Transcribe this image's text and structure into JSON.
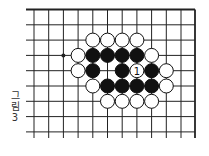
{
  "figure": {
    "label_lines": [
      "그",
      "림",
      "3"
    ],
    "label": "그림 3"
  },
  "board": {
    "cols_x": [
      34,
      48.7,
      63.4,
      78.1,
      92.8,
      107.5,
      122.2,
      136.9,
      151.6,
      166.3,
      181,
      195
    ],
    "rows_y": [
      9.5,
      24.8,
      40.1,
      55.4,
      70.7,
      86,
      101.3,
      116.6,
      131.9
    ],
    "grid_left": 26,
    "grid_right": 195,
    "grid_top": 9.5,
    "grid_bottom": 138,
    "top_border": true,
    "right_border": true,
    "stone_radius": 7,
    "line_color": "#222222",
    "black_color": "#111111",
    "white_color": "#ffffff",
    "star_point": {
      "col": 2,
      "row": 3
    },
    "stones": [
      {
        "col": 4,
        "row": 2,
        "color": "white"
      },
      {
        "col": 5,
        "row": 2,
        "color": "white"
      },
      {
        "col": 6,
        "row": 2,
        "color": "white"
      },
      {
        "col": 7,
        "row": 2,
        "color": "white"
      },
      {
        "col": 3,
        "row": 3,
        "color": "white"
      },
      {
        "col": 4,
        "row": 3,
        "color": "black"
      },
      {
        "col": 5,
        "row": 3,
        "color": "black"
      },
      {
        "col": 6,
        "row": 3,
        "color": "black"
      },
      {
        "col": 7,
        "row": 3,
        "color": "black"
      },
      {
        "col": 8,
        "row": 3,
        "color": "white"
      },
      {
        "col": 3,
        "row": 4,
        "color": "white"
      },
      {
        "col": 4,
        "row": 4,
        "color": "black"
      },
      {
        "col": 6,
        "row": 4,
        "color": "black"
      },
      {
        "col": 7,
        "row": 4,
        "color": "white",
        "number": "1"
      },
      {
        "col": 8,
        "row": 4,
        "color": "black"
      },
      {
        "col": 9,
        "row": 4,
        "color": "white"
      },
      {
        "col": 4,
        "row": 5,
        "color": "white"
      },
      {
        "col": 5,
        "row": 5,
        "color": "black"
      },
      {
        "col": 6,
        "row": 5,
        "color": "black"
      },
      {
        "col": 7,
        "row": 5,
        "color": "black"
      },
      {
        "col": 8,
        "row": 5,
        "color": "black"
      },
      {
        "col": 9,
        "row": 5,
        "color": "white"
      },
      {
        "col": 5,
        "row": 6,
        "color": "white"
      },
      {
        "col": 6,
        "row": 6,
        "color": "white"
      },
      {
        "col": 7,
        "row": 6,
        "color": "white"
      },
      {
        "col": 8,
        "row": 6,
        "color": "white"
      }
    ]
  }
}
